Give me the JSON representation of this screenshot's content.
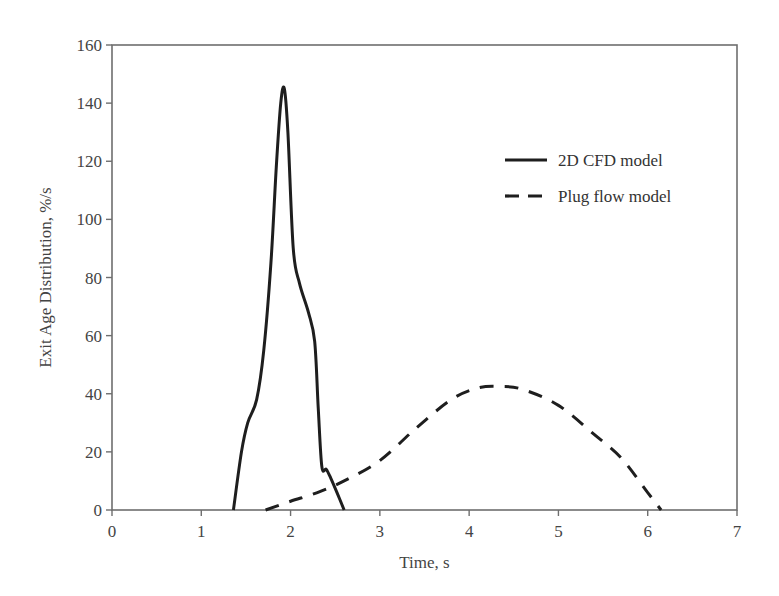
{
  "chart_data": {
    "type": "line",
    "title": "",
    "xlabel": "Time, s",
    "ylabel": "Exit Age Distribution, %/s",
    "xlim": [
      0,
      7
    ],
    "ylim": [
      0,
      160
    ],
    "xticks": [
      0,
      1,
      2,
      3,
      4,
      5,
      6,
      7
    ],
    "yticks": [
      0,
      20,
      40,
      60,
      80,
      100,
      120,
      140,
      160
    ],
    "grid": false,
    "legend_position": "upper right",
    "series": [
      {
        "name": "2D CFD model",
        "style": "solid",
        "x": [
          1.36,
          1.45,
          1.52,
          1.62,
          1.7,
          1.78,
          1.84,
          1.89,
          1.93,
          1.97,
          2.03,
          2.1,
          2.2,
          2.27,
          2.31,
          2.35,
          2.4,
          2.45,
          2.52,
          2.6
        ],
        "y": [
          0,
          20,
          30,
          38,
          55,
          85,
          118,
          140,
          145,
          130,
          90,
          78,
          68,
          58,
          35,
          15,
          14,
          11,
          6,
          0
        ]
      },
      {
        "name": "Plug flow model",
        "style": "dashed",
        "x": [
          1.72,
          2.0,
          2.3,
          2.6,
          3.0,
          3.4,
          3.8,
          4.1,
          4.35,
          4.6,
          5.0,
          5.4,
          5.7,
          6.0,
          6.15
        ],
        "y": [
          0,
          3,
          6,
          10,
          17,
          28,
          38,
          42,
          42.5,
          41.5,
          36,
          26,
          18,
          6,
          0
        ]
      }
    ]
  }
}
